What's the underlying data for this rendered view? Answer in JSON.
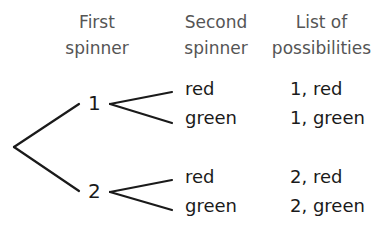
{
  "headers": {
    "first_spinner": [
      "First",
      "spinner"
    ],
    "second_spinner": [
      "Second",
      "spinner"
    ],
    "list_of_possibilities": [
      "List of",
      "possibilities"
    ]
  },
  "tree": {
    "first_spinner_outcomes": [
      "1",
      "2"
    ],
    "second_spinner_outcomes": {
      "1": [
        "red",
        "green"
      ],
      "2": [
        "red",
        "green"
      ]
    }
  },
  "possibilities": [
    "1, red",
    "1, green",
    "2, red",
    "2, green"
  ],
  "colors": {
    "header_text": "#555555",
    "body_text": "#1a1a1a",
    "lines": "#1a1a1a"
  }
}
